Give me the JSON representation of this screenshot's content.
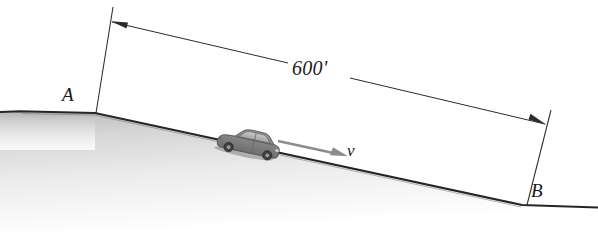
{
  "figure": {
    "background_color": "#ffffff",
    "width": 598,
    "height": 232
  },
  "labels": {
    "point_a": "A",
    "point_b": "B",
    "distance": "600'",
    "velocity": "v"
  },
  "colors": {
    "line": "#1a1a1a",
    "ground_fill_top": "#b8b8b8",
    "ground_fill_bottom": "#ffffff",
    "car_body": "#8a8a8a",
    "car_shadow": "#5f5f5f",
    "arrow_velocity": "#8c8c8c",
    "dimension_line": "#2b2b2b"
  },
  "geometry": {
    "ground_profile": "flat crest from left edge to A, then straight incline down to B, then flat to right edge",
    "crest_point": [
      95,
      113
    ],
    "point_a_vertex": [
      96,
      113
    ],
    "point_b_vertex": [
      522,
      205
    ],
    "dimension_left_arrow_tip": [
      112,
      22
    ],
    "dimension_right_arrow_tip": [
      545,
      124
    ],
    "extension_line_left": [
      [
        113,
        7
      ],
      [
        96,
        113
      ]
    ],
    "extension_line_right": [
      [
        551,
        110
      ],
      [
        527,
        205
      ]
    ],
    "velocity_arrow": [
      [
        278,
        141
      ],
      [
        346,
        156
      ]
    ],
    "car_position": [
      222,
      124
    ]
  },
  "icons": {
    "car": "car-icon",
    "velocity_arrow": "arrow-right-icon",
    "dimension_arrow_left": "arrow-left-icon",
    "dimension_arrow_right": "arrow-right-icon"
  }
}
